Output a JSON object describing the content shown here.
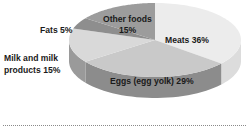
{
  "chart_data": {
    "type": "pie",
    "style": "3d",
    "title": "",
    "slices": [
      {
        "label": "Meats",
        "value": 36,
        "display": "Meats 36%",
        "top_color": "#ececec",
        "side_color": "#dcdcdc"
      },
      {
        "label": "Eggs (egg yolk)",
        "value": 29,
        "display": "Eggs (egg yolk) 29%",
        "top_color": "#c9c9c9",
        "side_color": "#8c8c8c"
      },
      {
        "label": "Milk and milk products",
        "value": 15,
        "display_lines": [
          "Milk and milk",
          "products 15%"
        ],
        "top_color": "#d9d9d9",
        "side_color": "#9a9a9a"
      },
      {
        "label": "Fats",
        "value": 5,
        "display": "Fats 5%",
        "top_color": "#8e8e8e",
        "side_color": "#7a7a7a"
      },
      {
        "label": "Other foods",
        "value": 15,
        "display_lines": [
          "Other foods",
          "15%"
        ],
        "top_color": "#9c9c9c",
        "side_color": "#888888"
      }
    ],
    "start": "top",
    "direction": "clockwise",
    "legend": "none"
  }
}
